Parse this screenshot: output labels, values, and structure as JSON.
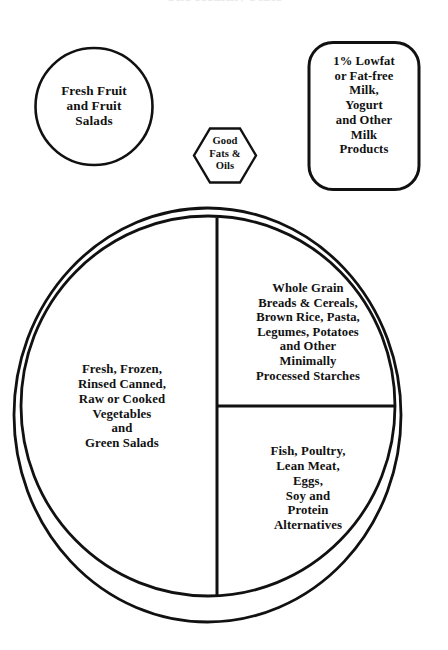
{
  "diagram": {
    "title_remnant": "The Healthy Plate",
    "background_color": "#ffffff",
    "stroke_color": "#111111",
    "text_color": "#111111",
    "groups": [
      {
        "name": "fruit",
        "shape": "circle",
        "text": "Fresh Fruit\nand Fruit\nSalads"
      },
      {
        "name": "fats-oils",
        "shape": "hexagon",
        "text": "Good\nFats &\nOils"
      },
      {
        "name": "milk",
        "shape": "rounded-rectangle",
        "text": "1% Lowfat\nor Fat-free\nMilk,\nYogurt\nand Other\nMilk\nProducts"
      },
      {
        "name": "vegetables",
        "shape": "plate-left-half",
        "text": "Fresh, Frozen,\nRinsed Canned,\nRaw or Cooked\nVegetables\nand\nGreen Salads"
      },
      {
        "name": "grains",
        "shape": "plate-upper-right-quadrant",
        "text": "Whole Grain\nBreads & Cereals,\nBrown Rice, Pasta,\nLegumes, Potatoes\nand Other\nMinimally\nProcessed Starches"
      },
      {
        "name": "protein",
        "shape": "plate-lower-right-quadrant",
        "text": "Fish, Poultry,\nLean Meat,\nEggs,\nSoy and\nProtein\nAlternatives"
      }
    ]
  }
}
